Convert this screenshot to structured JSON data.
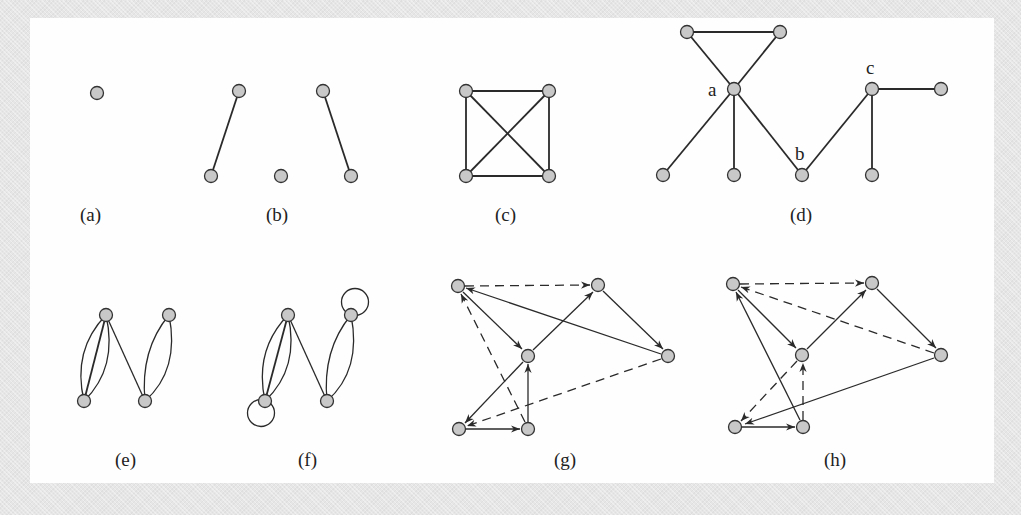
{
  "figure": {
    "panels": [
      {
        "id": "a",
        "caption": "(a)",
        "type": "undirected",
        "description": "single isolated vertex"
      },
      {
        "id": "b",
        "caption": "(b)",
        "type": "undirected",
        "description": "two disjoint edges plus an isolated vertex"
      },
      {
        "id": "c",
        "caption": "(c)",
        "type": "undirected",
        "description": "complete graph K4"
      },
      {
        "id": "d",
        "caption": "(d)",
        "type": "undirected",
        "description": "graph with cut vertices",
        "vertex_labels": [
          "a",
          "b",
          "c"
        ]
      },
      {
        "id": "e",
        "caption": "(e)",
        "type": "multigraph",
        "description": "multigraph with parallel edges"
      },
      {
        "id": "f",
        "caption": "(f)",
        "type": "pseudograph",
        "description": "multigraph with parallel edges and loops"
      },
      {
        "id": "g",
        "caption": "(g)",
        "type": "directed",
        "description": "directed graph, solid and dashed arcs"
      },
      {
        "id": "h",
        "caption": "(h)",
        "type": "directed",
        "description": "directed graph, solid and dashed arcs"
      }
    ],
    "colors": {
      "node_fill": "#c8c8c8",
      "node_stroke": "#333333",
      "edge": "#2a2a2a",
      "panel_bg": "#fefefe",
      "frame_bg": "#e6e6e6"
    }
  }
}
